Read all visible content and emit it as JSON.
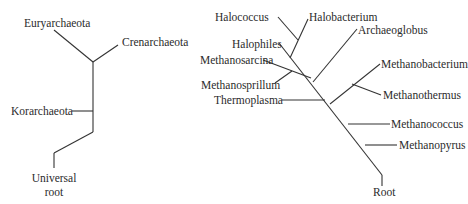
{
  "left_tree": {
    "labels": {
      "euryarchaeota": "Euryarchaeota",
      "crenarchaeota": "Crenarchaeota",
      "korarchaeota": "Korarchaeota",
      "root_line1": "Universal",
      "root_line2": "root"
    }
  },
  "right_tree": {
    "labels": {
      "halococcus": "Halococcus",
      "halobacterium": "Halobacterium",
      "halophiles": "Halophiles",
      "archaeoglobus": "Archaeoglobus",
      "methanosarcina": "Methanosarcina",
      "methanosprillum": "Methanosprillum",
      "thermoplasma": "Thermoplasma",
      "methanobacterium": "Methanobacterium",
      "methanothermus": "Methanothermus",
      "methanococcus": "Methanococcus",
      "methanopyrus": "Methanopyrus",
      "root": "Root"
    }
  },
  "colors": {
    "line": "#333333",
    "text": "#2b2b2b",
    "background": "#ffffff"
  }
}
